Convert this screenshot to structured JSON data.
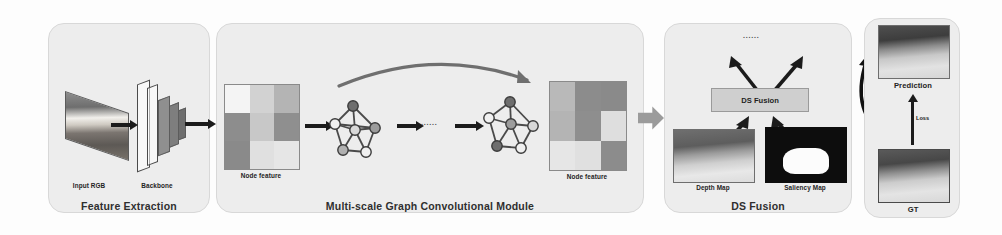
{
  "figure": {
    "type": "architecture-diagram"
  },
  "panels": [
    {
      "id": "feature-extraction",
      "title": "Feature Extraction",
      "labels": [
        {
          "name": "input-rgb",
          "text": "Input RGB"
        },
        {
          "name": "backbone",
          "text": "Backbone"
        }
      ]
    },
    {
      "id": "gcn-module",
      "title": "Multi-scale Graph Convolutional Module",
      "labels": [
        {
          "name": "node-feature-1",
          "text": "Node feature"
        },
        {
          "name": "node-feature-2",
          "text": "Node feature"
        }
      ],
      "ellipsis": "......"
    },
    {
      "id": "ds-fusion",
      "title": "DS Fusion",
      "labels": [
        {
          "name": "ds-fusion-box",
          "text": "DS Fusion"
        },
        {
          "name": "depth-map",
          "text": "Depth Map"
        },
        {
          "name": "saliency-map",
          "text": "Saliency Map"
        }
      ],
      "ellipsis": "......"
    },
    {
      "id": "prediction-gt",
      "labels": [
        {
          "name": "prediction",
          "text": "Prediction"
        },
        {
          "name": "ground-truth",
          "text": "GT"
        },
        {
          "name": "loss",
          "text": "Loss"
        }
      ]
    }
  ],
  "node_feature_grid_1": {
    "rows": 3,
    "cols": 3,
    "cells": [
      [
        "#f4f4f4",
        "#d2d2d2",
        "#b4b4b4"
      ],
      [
        "#8d8d8d",
        "#c8c8c8",
        "#8f8f8f"
      ],
      [
        "#8a8a8a",
        "#e0e0e0",
        "#e6e6e6"
      ]
    ]
  },
  "node_feature_grid_2": {
    "rows": 3,
    "cols": 3,
    "cells": [
      [
        "#b9b9b9",
        "#8c8c8c",
        "#8a8a8a"
      ],
      [
        "#b4b4b4",
        "#8e8e8e",
        "#dedede"
      ],
      [
        "#e6e6e6",
        "#e0e0e0",
        "#8c8c8c"
      ]
    ]
  },
  "graphs": [
    {
      "name": "graph-scale-1",
      "nodes": [
        {
          "cx": 22,
          "cy": 14,
          "fill": "#6e6e6e"
        },
        {
          "cx": 4,
          "cy": 32,
          "fill": "#f0f0f0"
        },
        {
          "cx": 44,
          "cy": 36,
          "fill": "#9c9c9c"
        },
        {
          "cx": 24,
          "cy": 38,
          "fill": "#d8d8d8"
        },
        {
          "cx": 12,
          "cy": 58,
          "fill": "#b0b0b0"
        },
        {
          "cx": 35,
          "cy": 60,
          "fill": "#f0f0f0"
        }
      ],
      "edges": [
        [
          0,
          1
        ],
        [
          0,
          2
        ],
        [
          0,
          3
        ],
        [
          1,
          3
        ],
        [
          1,
          4
        ],
        [
          2,
          3
        ],
        [
          2,
          5
        ],
        [
          3,
          4
        ],
        [
          3,
          5
        ],
        [
          4,
          5
        ],
        [
          1,
          2
        ]
      ]
    },
    {
      "name": "graph-scale-n",
      "nodes": [
        {
          "cx": 27,
          "cy": 12,
          "fill": "#6e6e6e"
        },
        {
          "cx": 6,
          "cy": 28,
          "fill": "#f0f0f0"
        },
        {
          "cx": 28,
          "cy": 34,
          "fill": "#9c9c9c"
        },
        {
          "cx": 50,
          "cy": 36,
          "fill": "#d8d8d8"
        },
        {
          "cx": 14,
          "cy": 56,
          "fill": "#6e6e6e"
        },
        {
          "cx": 38,
          "cy": 58,
          "fill": "#f0f0f0"
        }
      ],
      "edges": [
        [
          0,
          1
        ],
        [
          0,
          2
        ],
        [
          0,
          3
        ],
        [
          1,
          2
        ],
        [
          1,
          4
        ],
        [
          2,
          3
        ],
        [
          2,
          4
        ],
        [
          2,
          5
        ],
        [
          3,
          5
        ],
        [
          4,
          5
        ]
      ]
    }
  ],
  "colors": {
    "panel_bg": "#ededed",
    "panel_border": "#d8d8d8",
    "arrow": "#1b1b1b",
    "block_arrow": "#9b9b9b",
    "ds_box_bg": "#cfcfcf"
  }
}
